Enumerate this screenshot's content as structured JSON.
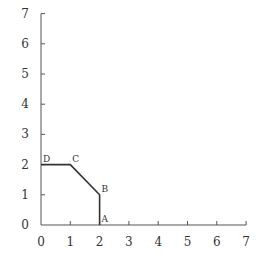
{
  "chart_data": {
    "type": "line",
    "title": "",
    "xlabel": "",
    "ylabel": "",
    "xlim": [
      0,
      7
    ],
    "ylim": [
      0,
      7
    ],
    "grid": false,
    "x_ticks": [
      "0",
      "1",
      "2",
      "3",
      "4",
      "5",
      "6",
      "7"
    ],
    "y_ticks": [
      "0",
      "1",
      "2",
      "3",
      "4",
      "5",
      "6",
      "7"
    ],
    "series": [
      {
        "name": "feasible-region-boundary",
        "points": [
          {
            "label": "D",
            "x": 0,
            "y": 2
          },
          {
            "label": "C",
            "x": 1,
            "y": 2
          },
          {
            "label": "B",
            "x": 2,
            "y": 1
          },
          {
            "label": "A",
            "x": 2,
            "y": 0
          }
        ]
      }
    ]
  },
  "colors": {
    "axis": "#555555",
    "line": "#333333",
    "text": "#333333"
  }
}
